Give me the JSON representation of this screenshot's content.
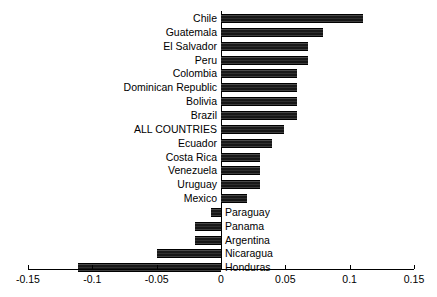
{
  "chart_data": {
    "type": "bar",
    "orientation": "horizontal",
    "title": "",
    "subtitle": "",
    "xlabel": "",
    "ylabel": "",
    "xlim": [
      -0.15,
      0.15
    ],
    "xticks": [
      -0.15,
      -0.1,
      -0.05,
      0,
      0.05,
      0.1,
      0.15
    ],
    "xtick_labels": [
      "-0.15",
      "-0.1",
      "-0.05",
      "0",
      "0.05",
      "0.1",
      "0.15"
    ],
    "grid": false,
    "legend": null,
    "bar_color": "#2b2b2b",
    "categories": [
      "Chile",
      "Guatemala",
      "El Salvador",
      "Peru",
      "Colombia",
      "Dominican Republic",
      "Bolivia",
      "Brazil",
      "ALL COUNTRIES",
      "Ecuador",
      "Costa Rica",
      "Venezuela",
      "Uruguay",
      "Mexico",
      "Paraguay",
      "Panama",
      "Argentina",
      "Nicaragua",
      "Honduras"
    ],
    "values": [
      0.11,
      0.079,
      0.068,
      0.068,
      0.059,
      0.059,
      0.059,
      0.059,
      0.049,
      0.04,
      0.03,
      0.03,
      0.03,
      0.02,
      -0.008,
      -0.02,
      -0.02,
      -0.05,
      -0.111
    ]
  },
  "axis": {
    "tick_labels": [
      "-0.15",
      "-0.1",
      "-0.05",
      "0",
      "0.05",
      "0.1",
      "0.15"
    ]
  }
}
